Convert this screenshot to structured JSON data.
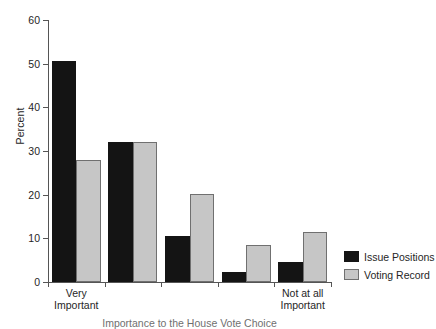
{
  "chart_data": {
    "type": "bar",
    "title": "",
    "xlabel": "Importance to the House Vote Choice",
    "ylabel": "Percent",
    "ylim": [
      0,
      60
    ],
    "yticks": [
      0,
      10,
      20,
      30,
      40,
      50,
      60
    ],
    "ytick_labels": [
      "0",
      "10",
      "20",
      "30",
      "40",
      "50",
      "60"
    ],
    "grid": false,
    "legend_position": "right",
    "categories": [
      "Very Important",
      "",
      "",
      "",
      "Not at all Important"
    ],
    "category_lines": [
      [
        "Very",
        "Important"
      ],
      [
        "",
        ""
      ],
      [
        "",
        ""
      ],
      [
        "",
        ""
      ],
      [
        "Not at all",
        "Important"
      ]
    ],
    "series": [
      {
        "name": "Issue Positions",
        "color": "#141414",
        "values": [
          50.7,
          32.1,
          10.6,
          2.3,
          4.6
        ]
      },
      {
        "name": "Voting Record",
        "color": "#c6c6c6",
        "values": [
          27.9,
          32.1,
          20.2,
          8.5,
          11.5
        ]
      }
    ]
  }
}
